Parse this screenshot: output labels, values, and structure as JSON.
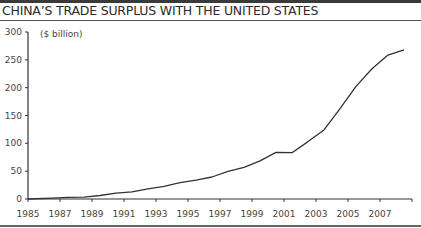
{
  "header": {
    "title": "CHINA’S TRADE SURPLUS WITH THE UNITED STATES"
  },
  "colors": {
    "line": "#333333",
    "axis": "#333333",
    "rule": "#3a3a3a"
  },
  "chart_data": {
    "type": "line",
    "title": "CHINA’S TRADE SURPLUS WITH THE UNITED STATES",
    "xlabel": "",
    "ylabel": "($ billion)",
    "unit_label": "($ billion)",
    "ylim": [
      0,
      300
    ],
    "xlim": [
      1985,
      2009
    ],
    "yticks": [
      0,
      50,
      100,
      150,
      200,
      250,
      300
    ],
    "xticks": [
      1985,
      1987,
      1989,
      1991,
      1993,
      1995,
      1997,
      1999,
      2001,
      2003,
      2005,
      2007
    ],
    "grid": false,
    "legend": null,
    "series": [
      {
        "name": "Trade surplus",
        "x": [
          1985,
          1986,
          1987,
          1988,
          1989,
          1990,
          1991,
          1992,
          1993,
          1994,
          1995,
          1996,
          1997,
          1998,
          1999,
          2000,
          2001,
          2002,
          2003,
          2004,
          2005,
          2006,
          2007,
          2008
        ],
        "values": [
          0,
          1.7,
          2.8,
          3.5,
          6.2,
          10.4,
          12.7,
          18.3,
          22.8,
          29.5,
          33.8,
          39.5,
          49.7,
          56.9,
          68.7,
          83.8,
          83.1,
          103.1,
          124.1,
          162.3,
          202.3,
          234.1,
          258.5,
          268.0
        ]
      }
    ]
  }
}
